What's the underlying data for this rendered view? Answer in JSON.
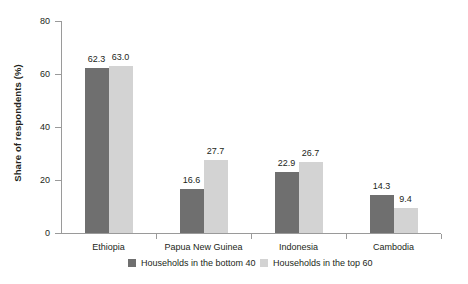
{
  "chart_data": {
    "type": "bar",
    "title": "",
    "subtitle": "",
    "xlabel": "",
    "ylabel": "Share of respondents (%)",
    "ylim": [
      0,
      80
    ],
    "yticks": [
      0,
      20,
      40,
      60,
      80
    ],
    "ytick_labels": [
      "0",
      "20",
      "40",
      "60",
      "80"
    ],
    "grid": false,
    "legend_position": "bottom",
    "categories": [
      "Ethiopia",
      "Papua New Guinea",
      "Indonesia",
      "Cambodia"
    ],
    "series": [
      {
        "name": "Households in the bottom 40",
        "color": "#6f6f6f",
        "values": [
          62.3,
          16.6,
          22.9,
          14.3
        ],
        "labels": [
          "62.3",
          "16.6",
          "22.9",
          "14.3"
        ]
      },
      {
        "name": "Households in the top 60",
        "color": "#d3d3d3",
        "values": [
          63.0,
          27.7,
          26.7,
          9.4
        ],
        "labels": [
          "63.0",
          "27.7",
          "26.7",
          "9.4"
        ]
      }
    ]
  },
  "legend": {
    "items": [
      {
        "label": "Households in the bottom 40"
      },
      {
        "label": "Households in the top 60"
      }
    ]
  },
  "colors": {
    "series_dark": "#6f6f6f",
    "series_light": "#d3d3d3",
    "axis": "#9a9a9a",
    "text": "#231f20",
    "background": "#ffffff"
  }
}
